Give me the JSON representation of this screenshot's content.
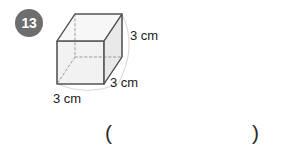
{
  "page": {
    "background_color": "#ffffff",
    "width": 290,
    "height": 151
  },
  "question": {
    "number": "13",
    "badge_color": "#6e6e6e",
    "badge_text_color": "#ffffff"
  },
  "figure": {
    "shape_name": "cube",
    "projection": "oblique",
    "face_fill_light": "#f4f4f4",
    "face_fill_mid": "#ebebeb",
    "face_fill_dark": "#e2e2e2",
    "edge_color": "#555555",
    "hidden_edge_color": "#9a9a9a",
    "leader_color": "#cfcfcf",
    "labels": {
      "height": "3 cm",
      "depth": "3 cm",
      "width": "3 cm"
    }
  },
  "answer": {
    "open_paren": "(",
    "close_paren": ")",
    "value": ""
  }
}
